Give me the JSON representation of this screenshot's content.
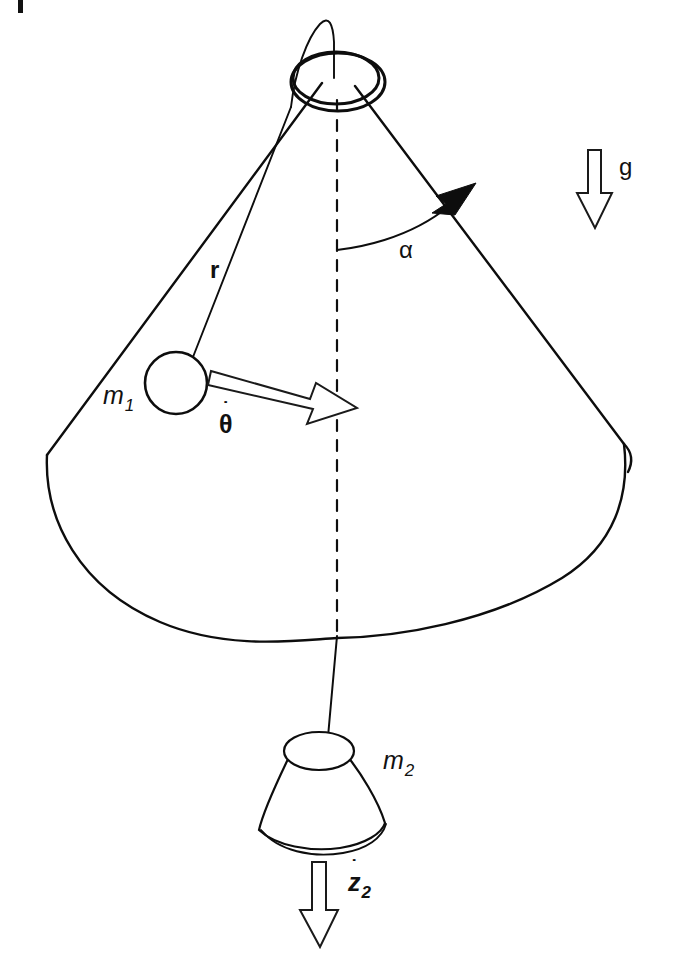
{
  "figure": {
    "background_color": "#ffffff",
    "ink_color": "#0d0d0d",
    "width": 673,
    "height": 960
  },
  "labels": {
    "mass1": {
      "symbol": "m",
      "subscript": "1"
    },
    "mass2": {
      "symbol": "m",
      "subscript": "2"
    },
    "radius": "r",
    "angle": "α",
    "gravity": "g",
    "theta_dot": {
      "symbol": "θ",
      "dot": "˙",
      "subscript": ""
    },
    "z_dot_2": {
      "symbol": "z",
      "dot": "˙",
      "subscript": "2"
    }
  },
  "elements": {
    "cone_surface": "cone-outline",
    "apex_ring": "apex-ring-hole",
    "vertical_axis": "dashed-axis",
    "string_upper": "string-from-m1-to-apex",
    "string_lower": "string-from-apex-to-m2",
    "mass1_shape": "circle",
    "mass2_shape": "frustum",
    "angle_arc": "alpha-arc",
    "theta_arrow": "hollow-arrow-right-down",
    "z_arrow": "hollow-arrow-down",
    "g_arrow": "hollow-arrow-down"
  },
  "geometry": {
    "apex": {
      "x": 337,
      "y": 85
    },
    "cone_base_center": {
      "x": 337,
      "y": 468
    },
    "cone_base_rx": 292,
    "cone_base_ry": 172,
    "mass1_center": {
      "x": 176,
      "y": 382
    },
    "mass1_radius": 30,
    "mass2_center": {
      "x": 320,
      "y": 790
    },
    "axis_top": {
      "x": 337,
      "y": 95
    },
    "axis_bottom": {
      "x": 337,
      "y": 640
    }
  }
}
